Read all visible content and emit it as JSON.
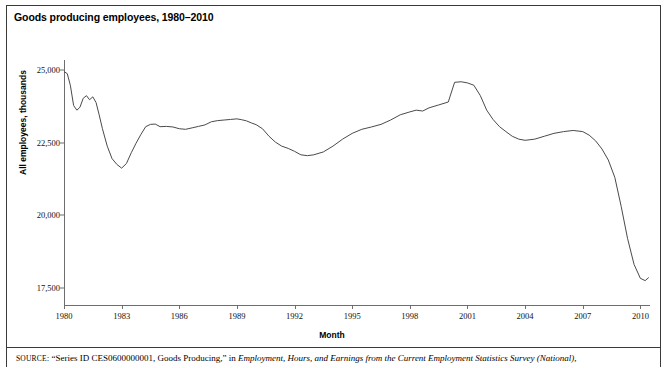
{
  "figure": {
    "title": "Goods producing employees, 1980–2010",
    "source_prefix": "SOURCE",
    "source_roman_1": ": “Series ID CES0600000001, Goods Producing,” in ",
    "source_italic": "Employment, Hours, and Earnings from the Current Employment Statistics Survey (National)",
    "source_roman_2": ","
  },
  "chart_data": {
    "type": "line",
    "title": "Goods producing employees, 1980–2010",
    "xlabel": "Month",
    "ylabel": "All employees, thousands",
    "xlim": [
      1980,
      2010.5
    ],
    "ylim": [
      16900,
      25350
    ],
    "grid": false,
    "legend": null,
    "yticks": [
      17500,
      20000,
      22500,
      25000
    ],
    "ytick_labels": [
      "17,500",
      "20,000",
      "22,500",
      "25,000"
    ],
    "xticks": [
      1980,
      1983,
      1986,
      1989,
      1992,
      1995,
      1998,
      2001,
      2004,
      2007,
      2010
    ],
    "xtick_labels": [
      "1980",
      "1983",
      "1986",
      "1989",
      "1992",
      "1995",
      "1998",
      "2001",
      "2004",
      "2007",
      "2010"
    ],
    "series": [
      {
        "name": "All employees, goods producing, thousands",
        "color": "#4a4a4a",
        "x": [
          1980.0,
          1980.17,
          1980.33,
          1980.5,
          1980.67,
          1980.83,
          1981.0,
          1981.17,
          1981.33,
          1981.5,
          1981.67,
          1981.83,
          1982.0,
          1982.25,
          1982.5,
          1982.75,
          1983.0,
          1983.25,
          1983.5,
          1983.75,
          1984.0,
          1984.25,
          1984.5,
          1984.75,
          1985.0,
          1985.33,
          1985.67,
          1986.0,
          1986.33,
          1986.67,
          1987.0,
          1987.33,
          1987.67,
          1988.0,
          1988.33,
          1988.67,
          1989.0,
          1989.25,
          1989.5,
          1989.75,
          1990.0,
          1990.33,
          1990.67,
          1991.0,
          1991.33,
          1991.67,
          1992.0,
          1992.33,
          1992.67,
          1993.0,
          1993.5,
          1994.0,
          1994.5,
          1995.0,
          1995.5,
          1996.0,
          1996.5,
          1997.0,
          1997.5,
          1998.0,
          1998.33,
          1998.67,
          1999.0,
          1999.5,
          2000.0,
          2000.33,
          2000.67,
          2001.0,
          2001.33,
          2001.67,
          2002.0,
          2002.33,
          2002.67,
          2003.0,
          2003.33,
          2003.67,
          2004.0,
          2004.5,
          2005.0,
          2005.5,
          2006.0,
          2006.5,
          2007.0,
          2007.33,
          2007.67,
          2008.0,
          2008.33,
          2008.67,
          2009.0,
          2009.33,
          2009.67,
          2010.0,
          2010.25,
          2010.42
        ],
        "y": [
          24950,
          24880,
          24480,
          23780,
          23620,
          23720,
          24030,
          24120,
          23980,
          24080,
          23880,
          23460,
          22980,
          22380,
          21950,
          21750,
          21620,
          21780,
          22150,
          22480,
          22780,
          23050,
          23130,
          23140,
          23050,
          23060,
          23040,
          22980,
          22960,
          23010,
          23060,
          23110,
          23220,
          23260,
          23280,
          23300,
          23320,
          23290,
          23250,
          23180,
          23120,
          22980,
          22720,
          22520,
          22380,
          22300,
          22200,
          22080,
          22050,
          22080,
          22180,
          22380,
          22620,
          22820,
          22960,
          23040,
          23130,
          23280,
          23460,
          23560,
          23620,
          23590,
          23700,
          23800,
          23900,
          24580,
          24600,
          24560,
          24480,
          24120,
          23620,
          23300,
          23050,
          22880,
          22720,
          22620,
          22580,
          22620,
          22720,
          22820,
          22880,
          22920,
          22880,
          22760,
          22560,
          22280,
          21900,
          21300,
          20300,
          19200,
          18300,
          17820,
          17740,
          17840
        ]
      }
    ],
    "annotations": []
  }
}
